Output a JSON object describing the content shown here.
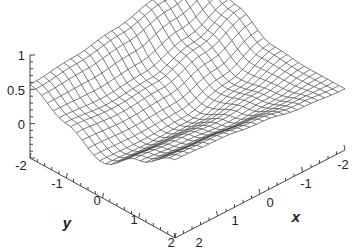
{
  "chart_data": {
    "type": "surface3d",
    "title": "",
    "xlabel": "x",
    "ylabel": "y",
    "zlabel": "",
    "x_ticks": [
      "-2",
      "-1",
      "0",
      "1",
      "2"
    ],
    "y_ticks": [
      "-2",
      "-1",
      "0",
      "1",
      "2"
    ],
    "z_ticks": [
      "1",
      "0.5",
      "0",
      "-2"
    ],
    "xlim": [
      -2,
      2
    ],
    "ylim": [
      -2,
      2
    ],
    "zlim": [
      -0.5,
      1.1
    ],
    "grid_resolution": 25,
    "style": "wireframe",
    "line_color": "#444444",
    "z_grid_note": "z values estimated at x (rows) and y (columns) in [-2,-1,0,1,2]",
    "grid_x": [
      -2,
      -1,
      0,
      1,
      2
    ],
    "grid_y": [
      -2,
      -1,
      0,
      1,
      2
    ],
    "z_values": [
      [
        1.05,
        0.75,
        0.45,
        0.4,
        0.4
      ],
      [
        0.9,
        0.5,
        0.2,
        0.3,
        0.45
      ],
      [
        0.75,
        0.3,
        0.02,
        0.25,
        0.55
      ],
      [
        0.65,
        0.25,
        0.0,
        0.3,
        0.62
      ],
      [
        0.58,
        0.3,
        0.02,
        0.35,
        0.65
      ]
    ]
  },
  "labels": {
    "z_tick_1": "1",
    "z_tick_05": "0.5",
    "z_tick_0": "0",
    "y_tick_m2": "-2",
    "y_tick_m1": "-1",
    "y_tick_0": "0",
    "y_tick_1": "1",
    "y_tick_2": "2",
    "x_tick_2": "2",
    "x_tick_1": "1",
    "x_tick_0": "0",
    "x_tick_m1": "-1",
    "x_tick_m2": "-2",
    "x_title": "x",
    "y_title": "y"
  }
}
